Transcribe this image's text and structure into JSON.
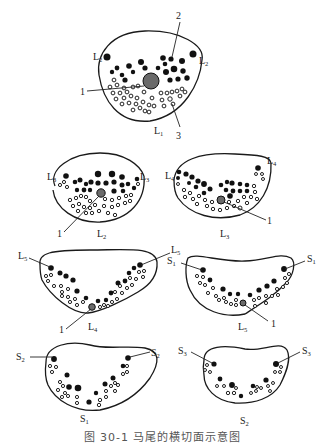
{
  "figure": {
    "caption": "图 30-1  马尾的横切面示意图",
    "legend": {
      "1": "filum terminale (hatched circle)",
      "2": "motor roots (filled circles)",
      "3": "sensory roots (hollow circles)"
    },
    "panels": [
      {
        "id": "L1",
        "title": "L",
        "title_sub": "1",
        "side_labels": [
          "L2",
          "L2"
        ],
        "callouts": [
          "1",
          "2",
          "3"
        ]
      },
      {
        "id": "L2",
        "title": "L",
        "title_sub": "2",
        "side_labels": [
          "L3",
          "L3"
        ],
        "callouts": [
          "1"
        ]
      },
      {
        "id": "L3",
        "title": "L",
        "title_sub": "3",
        "side_labels": [
          "L4",
          "L4"
        ],
        "callouts": [
          "1"
        ]
      },
      {
        "id": "L4",
        "title": "L",
        "title_sub": "4",
        "side_labels": [
          "L5",
          "L5"
        ],
        "callouts": [
          "1"
        ]
      },
      {
        "id": "L5",
        "title": "L",
        "title_sub": "5",
        "side_labels": [
          "S1",
          "S1"
        ],
        "callouts": [
          "1"
        ]
      },
      {
        "id": "S1",
        "title": "S",
        "title_sub": "1",
        "side_labels": [
          "S2",
          "S2"
        ],
        "callouts": []
      },
      {
        "id": "S2",
        "title": "S",
        "title_sub": "2",
        "side_labels": [
          "S3",
          "S3"
        ],
        "callouts": []
      }
    ],
    "colors": {
      "ink": "#111111",
      "filum": "#6a6a6a",
      "caption": "#555555",
      "background": "#ffffff"
    }
  }
}
